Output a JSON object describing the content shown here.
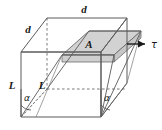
{
  "figure": {
    "type": "engineering-diagram",
    "background_color": "#ffffff",
    "line_color": "#4a4a4a",
    "dashed_color": "#6b6b6b",
    "shaded_face_color": "#d2d2d2",
    "text_color": "#1a1a1a",
    "labels": {
      "depth_front": "d",
      "depth_top": "d",
      "area": "A",
      "length_left": "L",
      "length_inner": "L",
      "angle_left": "α",
      "angle_right": "α",
      "shear_stress": "τ"
    }
  }
}
